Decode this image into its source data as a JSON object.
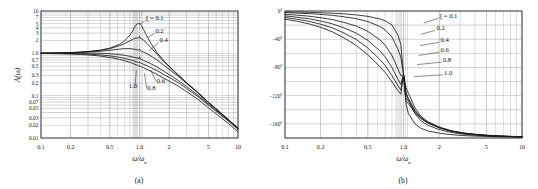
{
  "figure": {
    "background_color": "#ffffff",
    "line_color": "#1a1a1a",
    "grid_color": "#8c8c8c",
    "frame_color": "#333333"
  },
  "panel_a": {
    "caption": "(a)",
    "ylabel": "A(ω)",
    "xlabel": "ω/ω",
    "xlabel_sub": "n",
    "legend_lead": "ξ = 0.1",
    "legend_labels": [
      "0.2",
      "0.4",
      "0.6",
      "0.8",
      "1.0"
    ],
    "ytick_labels": [
      "10",
      "7",
      "5",
      "4",
      "3",
      "2",
      "1.0",
      "0.7",
      "0.5",
      "0.3",
      "0.2",
      "0.1",
      "0.07",
      "0.05",
      "0.03",
      "0.02",
      "0.01"
    ],
    "xtick_labels": [
      "0.1",
      "0.2",
      "0.5",
      "1.0",
      "2",
      "5",
      "10"
    ]
  },
  "panel_b": {
    "caption": "(b)",
    "xlabel": "ω/ω",
    "xlabel_sub": "n",
    "legend_lead": "ξ = 0.1",
    "legend_labels": [
      "0.2",
      "0.4",
      "0.6",
      "0.8",
      "1.0"
    ],
    "ytick_labels": [
      "0°",
      "−40°",
      "−80°",
      "−120°",
      "−160°"
    ],
    "xtick_labels": [
      "0.1",
      "0.2",
      "0.5",
      "1.0",
      "2",
      "5",
      "10"
    ]
  },
  "chart_data": [
    {
      "type": "line",
      "id": "panel-a-magnitude",
      "title": "",
      "xlabel": "ω/ωn",
      "ylabel": "A(ω)",
      "xscale": "log",
      "yscale": "log",
      "xlim": [
        0.1,
        10
      ],
      "ylim": [
        0.01,
        10
      ],
      "grid": true,
      "legend_position": "inside-upper-right",
      "xticks": [
        0.1,
        0.2,
        0.5,
        1.0,
        2,
        5,
        10
      ],
      "xticklabels": [
        "0.1",
        "0.2",
        "0.5",
        "1.0",
        "2",
        "5",
        "10"
      ],
      "yticks": [
        10,
        7,
        5,
        4,
        3,
        2,
        1.0,
        0.7,
        0.5,
        0.3,
        0.2,
        0.1,
        0.07,
        0.05,
        0.03,
        0.02,
        0.01
      ],
      "yticklabels": [
        "10",
        "7",
        "5",
        "4",
        "3",
        "2",
        "1.0",
        "0.7",
        "0.5",
        "0.3",
        "0.2",
        "0.1",
        "0.07",
        "0.05",
        "0.03",
        "0.02",
        "0.01"
      ],
      "x": [
        0.1,
        0.125,
        0.16,
        0.2,
        0.25,
        0.315,
        0.4,
        0.5,
        0.63,
        0.7,
        0.8,
        0.85,
        0.9,
        0.95,
        0.98,
        1.0,
        1.02,
        1.05,
        1.1,
        1.2,
        1.3,
        1.5,
        1.8,
        2.0,
        2.5,
        3.0,
        4.0,
        5.0,
        6.3,
        8.0,
        10.0
      ],
      "series": [
        {
          "name": "ξ = 0.1",
          "zeta": 0.1,
          "values": [
            1.01,
            1.016,
            1.026,
            1.042,
            1.07,
            1.114,
            1.19,
            1.327,
            1.645,
            1.937,
            2.706,
            3.373,
            4.385,
            5.0,
            5.036,
            5.0,
            4.897,
            4.53,
            3.644,
            2.452,
            1.763,
            1.054,
            0.634,
            0.494,
            0.302,
            0.203,
            0.113,
            0.07,
            0.044,
            0.027,
            0.017
          ],
          "color": "#1a1a1a"
        },
        {
          "name": "ξ = 0.2",
          "zeta": 0.2,
          "values": [
            1.009,
            1.015,
            1.025,
            1.04,
            1.065,
            1.107,
            1.176,
            1.291,
            1.516,
            1.678,
            1.983,
            2.135,
            2.256,
            2.3,
            2.29,
            2.5,
            2.268,
            2.218,
            2.051,
            1.687,
            1.384,
            0.96,
            0.612,
            0.484,
            0.3,
            0.202,
            0.113,
            0.07,
            0.044,
            0.027,
            0.017
          ],
          "color": "#1a1a1a"
        },
        {
          "name": "ξ = 0.4",
          "zeta": 0.4,
          "values": [
            1.006,
            1.012,
            1.019,
            1.031,
            1.049,
            1.078,
            1.12,
            1.18,
            1.259,
            1.287,
            1.289,
            1.272,
            1.243,
            1.205,
            1.18,
            1.25,
            1.145,
            1.117,
            1.068,
            0.968,
            0.871,
            0.703,
            0.505,
            0.421,
            0.281,
            0.195,
            0.111,
            0.069,
            0.044,
            0.027,
            0.017
          ],
          "color": "#1a1a1a"
        },
        {
          "name": "ξ = 0.6",
          "zeta": 0.6,
          "values": [
            1.0,
            1.002,
            1.005,
            1.008,
            1.011,
            1.011,
            1.004,
            0.98,
            0.93,
            0.9,
            0.85,
            0.823,
            0.795,
            0.768,
            0.752,
            0.833,
            0.732,
            0.713,
            0.682,
            0.623,
            0.569,
            0.478,
            0.367,
            0.316,
            0.226,
            0.164,
            0.099,
            0.064,
            0.041,
            0.026,
            0.017
          ],
          "color": "#1a1a1a"
        },
        {
          "name": "ξ = 0.8",
          "zeta": 0.8,
          "values": [
            0.995,
            0.992,
            0.988,
            0.982,
            0.971,
            0.952,
            0.921,
            0.873,
            0.802,
            0.763,
            0.706,
            0.678,
            0.65,
            0.623,
            0.607,
            0.625,
            0.591,
            0.576,
            0.551,
            0.504,
            0.462,
            0.393,
            0.309,
            0.27,
            0.199,
            0.148,
            0.092,
            0.06,
            0.039,
            0.025,
            0.016
          ],
          "color": "#1a1a1a"
        },
        {
          "name": "ξ = 1.0",
          "zeta": 1.0,
          "values": [
            0.99,
            0.985,
            0.976,
            0.962,
            0.941,
            0.909,
            0.862,
            0.8,
            0.716,
            0.674,
            0.61,
            0.58,
            0.55,
            0.524,
            0.508,
            0.5,
            0.492,
            0.478,
            0.454,
            0.413,
            0.376,
            0.32,
            0.252,
            0.222,
            0.166,
            0.125,
            0.079,
            0.052,
            0.034,
            0.022,
            0.014
          ],
          "color": "#1a1a1a"
        }
      ],
      "annotations": [
        {
          "text": "ξ = 0.1",
          "x": 1.15,
          "y": 6.2
        },
        {
          "text": "0.2",
          "x": 1.45,
          "y": 3.1
        },
        {
          "text": "0.4",
          "x": 1.6,
          "y": 1.85
        },
        {
          "text": "0.6",
          "x": 1.5,
          "y": 0.2
        },
        {
          "text": "0.8",
          "x": 1.2,
          "y": 0.135
        },
        {
          "text": "1.0",
          "x": 0.78,
          "y": 0.155
        }
      ]
    },
    {
      "type": "line",
      "id": "panel-b-phase",
      "title": "",
      "xlabel": "ω/ωn",
      "ylabel": "phase (degrees)",
      "xscale": "log",
      "yscale": "linear",
      "xlim": [
        0.1,
        10
      ],
      "ylim": [
        -180,
        0
      ],
      "grid": true,
      "legend_position": "inside-upper-right",
      "xticks": [
        0.1,
        0.2,
        0.5,
        1.0,
        2,
        5,
        10
      ],
      "xticklabels": [
        "0.1",
        "0.2",
        "0.5",
        "1.0",
        "2",
        "5",
        "10"
      ],
      "yticks": [
        0,
        -40,
        -80,
        -120,
        -160
      ],
      "yticklabels": [
        "0°",
        "−40°",
        "−80°",
        "−120°",
        "−160°"
      ],
      "x": [
        0.1,
        0.125,
        0.16,
        0.2,
        0.25,
        0.315,
        0.4,
        0.5,
        0.63,
        0.7,
        0.8,
        0.9,
        0.95,
        1.0,
        1.05,
        1.1,
        1.25,
        1.4,
        1.6,
        2.0,
        2.5,
        3.15,
        4.0,
        5.0,
        6.3,
        8.0,
        10.0
      ],
      "series": [
        {
          "name": "ξ = 0.1",
          "zeta": 0.1,
          "values": [
            -1.2,
            -1.5,
            -1.9,
            -2.4,
            -3.1,
            -4.1,
            -5.5,
            -7.6,
            -11.2,
            -13.9,
            -19.8,
            -34.6,
            -47.6,
            -90,
            -132.4,
            -145.4,
            -159.9,
            -166.1,
            -170.0,
            -173.2,
            -175.2,
            -176.5,
            -177.3,
            -177.7,
            -178.2,
            -178.5,
            -178.8
          ],
          "color": "#1a1a1a"
        },
        {
          "name": "ξ = 0.2",
          "zeta": 0.2,
          "values": [
            -2.3,
            -2.9,
            -3.7,
            -4.8,
            -6.1,
            -8.2,
            -10.9,
            -15.0,
            -21.8,
            -26.7,
            -36.9,
            -54.6,
            -65.5,
            -90,
            -114.5,
            -125.4,
            -145.6,
            -155.6,
            -161.9,
            -168.0,
            -172.0,
            -174.5,
            -176.0,
            -177.0,
            -177.7,
            -178.2,
            -178.6
          ],
          "color": "#1a1a1a"
        },
        {
          "name": "ξ = 0.4",
          "zeta": 0.4,
          "values": [
            -4.6,
            -5.8,
            -7.4,
            -9.5,
            -12.1,
            -16.2,
            -21.4,
            -28.9,
            -40.6,
            -48.3,
            -63.1,
            -82.6,
            -91.6,
            -90,
            -108.3,
            -116.6,
            -137.3,
            -149.0,
            -156.7,
            -164.4,
            -169.4,
            -172.6,
            -174.6,
            -175.9,
            -176.9,
            -177.6,
            -178.1
          ],
          "color": "#1a1a1a"
        },
        {
          "name": "ξ = 0.6",
          "zeta": 0.6,
          "values": [
            -6.9,
            -8.7,
            -11.1,
            -14.2,
            -18.1,
            -24.0,
            -31.4,
            -41.6,
            -56.3,
            -64.9,
            -80.3,
            -97.2,
            -104.1,
            -90,
            -118.3,
            -124.0,
            -140.9,
            -150.9,
            -157.9,
            -165.1,
            -170.0,
            -173.0,
            -175.0,
            -176.3,
            -177.2,
            -177.9,
            -178.3
          ],
          "color": "#1a1a1a"
        },
        {
          "name": "ξ = 0.8",
          "zeta": 0.8,
          "values": [
            -9.2,
            -11.5,
            -14.7,
            -18.7,
            -23.8,
            -31.3,
            -40.4,
            -52.5,
            -68.5,
            -77.2,
            -91.7,
            -106.2,
            -112.0,
            -90,
            -123.2,
            -127.8,
            -142.5,
            -151.6,
            -158.3,
            -165.4,
            -170.2,
            -173.2,
            -175.1,
            -176.4,
            -177.3,
            -177.9,
            -178.3
          ],
          "color": "#1a1a1a"
        },
        {
          "name": "ξ = 1.0",
          "zeta": 1.0,
          "values": [
            -11.5,
            -14.4,
            -18.3,
            -23.2,
            -29.4,
            -38.2,
            -48.8,
            -62.2,
            -78.6,
            -87.1,
            -100.5,
            -113.1,
            -118.0,
            -90,
            -127.6,
            -131.5,
            -144.1,
            -152.4,
            -158.7,
            -165.5,
            -170.2,
            -173.2,
            -175.1,
            -176.4,
            -177.3,
            -177.9,
            -178.3
          ],
          "color": "#1a1a1a"
        }
      ],
      "annotations": [
        {
          "text": "ξ = 0.1",
          "x": 2.0,
          "y": -10
        },
        {
          "text": "0.2",
          "x": 1.9,
          "y": -27
        },
        {
          "text": "0.4",
          "x": 2.05,
          "y": -44
        },
        {
          "text": "0.6",
          "x": 2.05,
          "y": -58
        },
        {
          "text": "0.8",
          "x": 2.15,
          "y": -72
        },
        {
          "text": "1.0",
          "x": 2.2,
          "y": -90
        }
      ]
    }
  ]
}
